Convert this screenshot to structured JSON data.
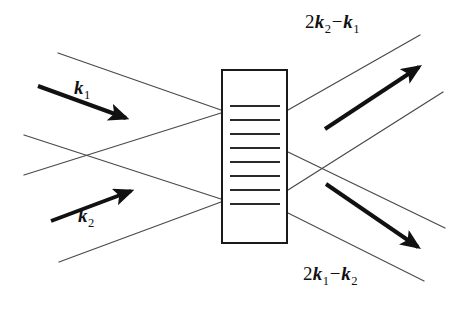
{
  "figure": {
    "kind": "wave-mixing-schematic",
    "width": 462,
    "height": 311,
    "background_color": "#ffffff",
    "line_color": "#1a1a1a",
    "thin_line_color": "#4a4a4a",
    "text_color": "#111111"
  },
  "labels": {
    "input_beam_1": {
      "coefficient": "",
      "vector": "k",
      "subscript": "1",
      "text": "k1"
    },
    "input_beam_2": {
      "coefficient": "",
      "vector": "k",
      "subscript": "2",
      "text": "k2"
    },
    "output_beam_top": {
      "coefficient": "2",
      "vector_a": "k",
      "subscript_a": "2",
      "operator": "−",
      "vector_b": "k",
      "subscript_b": "1",
      "text": "2k2−k1"
    },
    "output_beam_bottom": {
      "coefficient": "2",
      "vector_a": "k",
      "subscript_a": "1",
      "operator": "−",
      "vector_b": "k",
      "subscript_b": "2",
      "text": "2k1−k2"
    }
  },
  "medium": {
    "name": "grating-sample",
    "rect": {
      "x": 222,
      "y": 70,
      "width": 65,
      "height": 173
    },
    "border_width": 2,
    "fringe_count": 8,
    "fringe_x_start": 230,
    "fringe_x_end": 280,
    "fringe_y_values": [
      106,
      120,
      134,
      148,
      162,
      176,
      190,
      204
    ],
    "fringe_width": 2
  },
  "arrows": [
    {
      "name": "arrow-k1",
      "from": {
        "x": 38,
        "y": 86
      },
      "to": {
        "x": 130,
        "y": 120
      },
      "width": 4
    },
    {
      "name": "arrow-k2",
      "from": {
        "x": 51,
        "y": 221
      },
      "to": {
        "x": 135,
        "y": 189
      },
      "width": 4
    },
    {
      "name": "arrow-out-top",
      "from": {
        "x": 325,
        "y": 129
      },
      "to": {
        "x": 424,
        "y": 63
      },
      "width": 4
    },
    {
      "name": "arrow-out-bottom",
      "from": {
        "x": 326,
        "y": 184
      },
      "to": {
        "x": 423,
        "y": 251
      },
      "width": 4
    }
  ],
  "beam_envelope_lines": [
    {
      "name": "beam-in-upper-top",
      "x1": 58,
      "y1": 53,
      "x2": 221,
      "y2": 110
    },
    {
      "name": "beam-in-upper-bottom",
      "x1": 24,
      "y1": 175,
      "x2": 221,
      "y2": 113
    },
    {
      "name": "beam-in-lower-top",
      "x1": 24,
      "y1": 135,
      "x2": 221,
      "y2": 199
    },
    {
      "name": "beam-in-lower-bottom",
      "x1": 59,
      "y1": 262,
      "x2": 221,
      "y2": 202
    },
    {
      "name": "beam-out-upper-top",
      "x1": 288,
      "y1": 110,
      "x2": 420,
      "y2": 35
    },
    {
      "name": "beam-out-upper-bottom",
      "x1": 288,
      "y1": 152,
      "x2": 445,
      "y2": 228
    },
    {
      "name": "beam-out-lower-top",
      "x1": 288,
      "y1": 190,
      "x2": 443,
      "y2": 92
    },
    {
      "name": "beam-out-lower-bottom",
      "x1": 288,
      "y1": 213,
      "x2": 424,
      "y2": 281
    }
  ]
}
